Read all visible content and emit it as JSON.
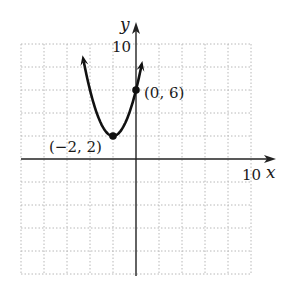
{
  "chart_data": {
    "type": "line",
    "title": "",
    "xlabel": "x",
    "ylabel": "y",
    "xlim": [
      -10,
      10
    ],
    "ylim": [
      -10,
      10
    ],
    "grid": true,
    "grid_step": 2,
    "tick_labels": {
      "x_max": "10",
      "y_max": "10"
    },
    "series": [
      {
        "name": "parabola",
        "equation": "y = (x + 2)^2 + 2",
        "x": [
          -4.6,
          -4,
          -3,
          -2,
          -1,
          0,
          0.4
        ],
        "y": [
          8.76,
          6,
          3,
          2,
          3,
          6,
          7.76
        ]
      }
    ],
    "points": [
      {
        "label": "(−2, 2)",
        "x": -2,
        "y": 2
      },
      {
        "label": "(0, 6)",
        "x": 0,
        "y": 6
      }
    ]
  },
  "labels": {
    "y_axis": "y",
    "x_axis": "x",
    "y_tick": "10",
    "x_tick": "10",
    "vertex": "(−2, 2)",
    "intercept": "(0, 6)"
  }
}
